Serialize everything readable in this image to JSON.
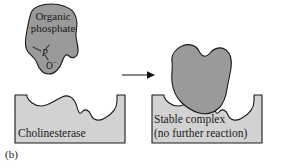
{
  "figure": {
    "panel_label": "(b)",
    "background_color": "#ffffff",
    "ligand_fill": "#9a9a9a",
    "enzyme_fill": "#d2d2d2",
    "outline_color": "#1a1a1a"
  },
  "ligand": {
    "label": "Organic phosphate",
    "structure": {
      "phosphorus_atom": "P",
      "oxygen_atom": "O",
      "oxygen_charge": "–"
    }
  },
  "enzyme_left": {
    "label": "Cholinesterase"
  },
  "enzyme_right": {
    "label_line1": "Stable complex",
    "label_line2": "(no further reaction)"
  },
  "reaction_arrow": {
    "direction": "right",
    "name": "reaction-arrow"
  }
}
